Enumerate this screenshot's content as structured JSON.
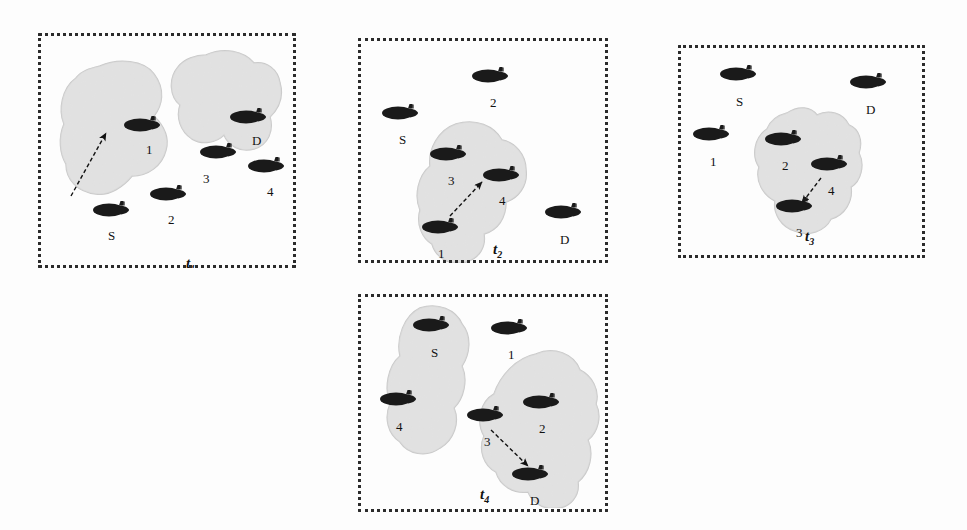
{
  "figure": {
    "type": "diagram",
    "caption_absent": true,
    "colors": {
      "blob_fill": "#d6d6d6",
      "blob_edge": "#c8c8c8",
      "submarine_body": "#1a1a1a",
      "border": "#2b2b2b",
      "background": "#fdfdfd",
      "label_text": "#111111"
    }
  },
  "panels": [
    {
      "id": "t1",
      "time_label": "t",
      "time_subscript": "1",
      "x": 38,
      "y": 33,
      "w": 258,
      "h": 235,
      "time_label_x": 148,
      "time_label_y": 222,
      "blobs": [
        {
          "name": "cluster-left",
          "x": 20,
          "y": 25,
          "w": 120,
          "h": 160,
          "path": "M 42 8 C 60 0 86 2 96 16 C 108 32 104 48 96 58 C 104 66 112 78 108 92 C 104 108 90 118 74 118 C 66 128 52 138 38 136 C 20 134 8 122 8 106 C 2 96 0 80 6 66 C 0 52 4 30 18 20 C 24 12 34 10 42 8 Z"
        },
        {
          "name": "cluster-right",
          "x": 128,
          "y": 16,
          "w": 118,
          "h": 118,
          "path": "M 40 6 C 58 -2 78 2 88 14 C 100 12 112 20 114 34 C 118 48 112 60 104 68 C 108 82 102 96 88 100 C 74 104 62 96 58 86 C 50 94 36 96 26 90 C 14 82 10 68 14 56 C 4 48 2 30 12 18 C 18 10 30 6 40 6 Z"
        }
      ],
      "submarines": [
        {
          "name": "node-1",
          "x": 84,
          "y": 83,
          "label": "1",
          "label_x": 108,
          "label_y": 110
        },
        {
          "name": "node-2",
          "x": 110,
          "y": 152,
          "label": "2",
          "label_x": 130,
          "label_y": 180
        },
        {
          "name": "node-S",
          "x": 53,
          "y": 168,
          "label": "S",
          "label_x": 70,
          "label_y": 196
        },
        {
          "name": "node-3",
          "x": 160,
          "y": 110,
          "label": "3",
          "label_x": 165,
          "label_y": 139
        },
        {
          "name": "node-D",
          "x": 190,
          "y": 75,
          "label": "D",
          "label_x": 214,
          "label_y": 101
        },
        {
          "name": "node-4",
          "x": 208,
          "y": 124,
          "label": "4",
          "label_x": 229,
          "label_y": 152
        }
      ],
      "arrows": [
        {
          "name": "arrow-S-to-1",
          "x1": 33,
          "y1": 163,
          "x2": 68,
          "y2": 100
        }
      ]
    },
    {
      "id": "t2",
      "time_label": "t",
      "time_subscript": "2",
      "x": 358,
      "y": 38,
      "w": 250,
      "h": 225,
      "time_label_x": 135,
      "time_label_y": 203,
      "blobs": [
        {
          "name": "cluster-center",
          "x": 52,
          "y": 82,
          "w": 122,
          "h": 143,
          "path": "M 46 4 C 66 -2 84 6 92 20 C 104 22 116 34 116 50 C 118 66 108 78 96 82 C 96 98 88 110 74 114 C 76 126 70 138 56 142 C 40 146 26 138 22 124 C 12 118 6 104 10 90 C 4 76 8 56 20 46 C 18 30 28 10 46 4 Z"
        }
      ],
      "submarines": [
        {
          "name": "node-2",
          "x": 112,
          "y": 29,
          "label": "2",
          "label_x": 132,
          "label_y": 58
        },
        {
          "name": "node-S",
          "x": 22,
          "y": 66,
          "label": "S",
          "label_x": 41,
          "label_y": 95
        },
        {
          "name": "node-3",
          "x": 70,
          "y": 107,
          "label": "3",
          "label_x": 90,
          "label_y": 136
        },
        {
          "name": "node-4",
          "x": 123,
          "y": 128,
          "label": "4",
          "label_x": 141,
          "label_y": 156
        },
        {
          "name": "node-1",
          "x": 62,
          "y": 180,
          "label": "1",
          "label_x": 80,
          "label_y": 209
        },
        {
          "name": "node-D",
          "x": 185,
          "y": 165,
          "label": "D",
          "label_x": 202,
          "label_y": 195
        }
      ],
      "arrows": [
        {
          "name": "arrow-1-to-4",
          "x1": 92,
          "y1": 178,
          "x2": 124,
          "y2": 144
        }
      ]
    },
    {
      "id": "t3",
      "time_label": "t",
      "time_subscript": "3",
      "x": 678,
      "y": 45,
      "w": 247,
      "h": 213,
      "time_label_x": 127,
      "time_label_y": 183,
      "blobs": [
        {
          "name": "cluster-center",
          "x": 65,
          "y": 62,
          "w": 122,
          "h": 130,
          "path": "M 44 6 C 56 -2 68 0 74 8 C 86 2 100 6 106 18 C 116 22 120 34 116 46 C 122 58 118 74 108 80 C 110 94 102 108 88 112 C 82 124 66 130 52 124 C 38 120 30 106 32 94 C 20 88 12 74 16 60 C 8 48 12 30 24 22 C 28 12 36 8 44 6 Z"
        }
      ],
      "submarines": [
        {
          "name": "node-S",
          "x": 40,
          "y": 20,
          "label": "S",
          "label_x": 58,
          "label_y": 50
        },
        {
          "name": "node-D",
          "x": 170,
          "y": 28,
          "label": "D",
          "label_x": 188,
          "label_y": 58
        },
        {
          "name": "node-1",
          "x": 13,
          "y": 80,
          "label": "1",
          "label_x": 32,
          "label_y": 110
        },
        {
          "name": "node-2",
          "x": 85,
          "y": 85,
          "label": "2",
          "label_x": 104,
          "label_y": 114
        },
        {
          "name": "node-4",
          "x": 131,
          "y": 110,
          "label": "4",
          "label_x": 150,
          "label_y": 139
        },
        {
          "name": "node-3",
          "x": 96,
          "y": 152,
          "label": "3",
          "label_x": 118,
          "label_y": 181
        }
      ],
      "arrows": [
        {
          "name": "arrow-4-to-3",
          "x1": 143,
          "y1": 133,
          "x2": 124,
          "y2": 158
        }
      ]
    },
    {
      "id": "t4",
      "time_label": "t",
      "time_subscript": "4",
      "x": 358,
      "y": 294,
      "w": 250,
      "h": 218,
      "time_label_x": 122,
      "time_label_y": 192,
      "blobs": [
        {
          "name": "cluster-left",
          "x": 18,
          "y": 10,
          "w": 105,
          "h": 160,
          "path": "M 44 4 C 62 -2 80 6 86 20 C 96 32 94 50 86 62 C 92 76 88 94 78 104 C 84 118 78 136 64 144 C 50 154 32 150 24 138 C 12 130 8 114 14 100 C 8 84 12 62 24 52 C 20 34 28 12 44 4 Z"
        },
        {
          "name": "cluster-right",
          "x": 100,
          "y": 56,
          "w": 145,
          "h": 158,
          "path": "M 78 4 C 96 -4 116 4 122 20 C 134 26 142 40 138 54 C 144 66 140 82 130 90 C 136 104 132 122 120 132 C 122 146 112 158 98 158 C 86 160 74 152 70 142 C 56 144 42 136 38 122 C 26 116 20 100 26 86 C 18 72 22 52 36 44 C 42 26 58 8 78 4 Z"
        }
      ],
      "submarines": [
        {
          "name": "node-S",
          "x": 53,
          "y": 22,
          "label": "S",
          "label_x": 73,
          "label_y": 52
        },
        {
          "name": "node-1",
          "x": 131,
          "y": 25,
          "label": "1",
          "label_x": 150,
          "label_y": 54
        },
        {
          "name": "node-4",
          "x": 20,
          "y": 96,
          "label": "4",
          "label_x": 38,
          "label_y": 126
        },
        {
          "name": "node-2",
          "x": 163,
          "y": 99,
          "label": "2",
          "label_x": 181,
          "label_y": 128
        },
        {
          "name": "node-3",
          "x": 107,
          "y": 112,
          "label": "3",
          "label_x": 126,
          "label_y": 141
        },
        {
          "name": "node-D",
          "x": 152,
          "y": 171,
          "label": "D",
          "label_x": 172,
          "label_y": 200
        }
      ],
      "arrows": [
        {
          "name": "arrow-3-to-D",
          "x1": 133,
          "y1": 136,
          "x2": 170,
          "y2": 172
        }
      ]
    }
  ]
}
